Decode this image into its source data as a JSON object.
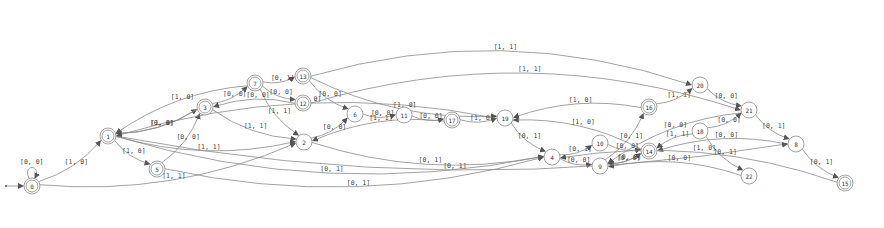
{
  "diagram": {
    "type": "finite-state-automaton",
    "start_state": "0",
    "nodes": [
      {
        "id": "0",
        "x": 32,
        "y": 186,
        "accepting": true
      },
      {
        "id": "1",
        "x": 108,
        "y": 136,
        "accepting": true
      },
      {
        "id": "5",
        "x": 157,
        "y": 169,
        "accepting": true
      },
      {
        "id": "3",
        "x": 205,
        "y": 107,
        "accepting": true
      },
      {
        "id": "7",
        "x": 255,
        "y": 83,
        "accepting": true
      },
      {
        "id": "13",
        "x": 303,
        "y": 76,
        "accepting": true
      },
      {
        "id": "12",
        "x": 303,
        "y": 103,
        "accepting": true
      },
      {
        "id": "2",
        "x": 304,
        "y": 142,
        "accepting": false
      },
      {
        "id": "6",
        "x": 355,
        "y": 114,
        "accepting": false
      },
      {
        "id": "11",
        "x": 404,
        "y": 115,
        "accepting": false
      },
      {
        "id": "17",
        "x": 452,
        "y": 120,
        "accepting": true
      },
      {
        "id": "19",
        "x": 505,
        "y": 118,
        "accepting": false
      },
      {
        "id": "4",
        "x": 552,
        "y": 157,
        "accepting": false
      },
      {
        "id": "10",
        "x": 600,
        "y": 143,
        "accepting": false
      },
      {
        "id": "9",
        "x": 600,
        "y": 166,
        "accepting": false
      },
      {
        "id": "16",
        "x": 649,
        "y": 107,
        "accepting": true
      },
      {
        "id": "14",
        "x": 649,
        "y": 151,
        "accepting": true
      },
      {
        "id": "20",
        "x": 700,
        "y": 85,
        "accepting": false
      },
      {
        "id": "18",
        "x": 700,
        "y": 131,
        "accepting": false
      },
      {
        "id": "21",
        "x": 749,
        "y": 110,
        "accepting": false
      },
      {
        "id": "22",
        "x": 749,
        "y": 176,
        "accepting": false
      },
      {
        "id": "8",
        "x": 796,
        "y": 144,
        "accepting": false
      },
      {
        "id": "15",
        "x": 845,
        "y": 183,
        "accepting": true
      }
    ],
    "edges": [
      {
        "from": "0",
        "to": "0",
        "label": "[0, 0]"
      },
      {
        "from": "0",
        "to": "1",
        "label": "[1, 0]"
      },
      {
        "from": "0",
        "to": "2",
        "label": "[1, 1]"
      },
      {
        "from": "1",
        "to": "5",
        "label": "[1, 0]"
      },
      {
        "from": "1",
        "to": "3",
        "label": "[0, 0]"
      },
      {
        "from": "3",
        "to": "1",
        "label": "[1, 0]"
      },
      {
        "from": "1",
        "to": "2",
        "label": "[1, 1]"
      },
      {
        "from": "1",
        "to": "4",
        "label": "[0, 1]"
      },
      {
        "from": "5",
        "to": "3",
        "label": "[0, 0]"
      },
      {
        "from": "5",
        "to": "4",
        "label": "[0, 1]"
      },
      {
        "from": "7",
        "to": "1",
        "label": "[1, 0]"
      },
      {
        "from": "3",
        "to": "7",
        "label": "[0, 0]"
      },
      {
        "from": "12",
        "to": "3",
        "label": "[0, 0]"
      },
      {
        "from": "3",
        "to": "2",
        "label": "[1, 1]"
      },
      {
        "from": "7",
        "to": "13",
        "label": "[0, 1]"
      },
      {
        "from": "7",
        "to": "12",
        "label": "[0, 0]"
      },
      {
        "from": "7",
        "to": "2",
        "label": "[1, 1]"
      },
      {
        "from": "13",
        "to": "6",
        "label": "[0, 0]"
      },
      {
        "from": "13",
        "to": "19",
        "label": "[1, 0]"
      },
      {
        "from": "13",
        "to": "20",
        "label": "[1, 1]"
      },
      {
        "from": "12",
        "to": "21",
        "label": "[1, 1]"
      },
      {
        "from": "2",
        "to": "6",
        "label": "[0, 0]"
      },
      {
        "from": "2",
        "to": "4",
        "label": "[0, 1]"
      },
      {
        "from": "17",
        "to": "2",
        "label": "[1, 1]"
      },
      {
        "from": "6",
        "to": "11",
        "label": "[0, 0]"
      },
      {
        "from": "11",
        "to": "17",
        "label": "[0, 0]"
      },
      {
        "from": "17",
        "to": "19",
        "label": "[1, 0]"
      },
      {
        "from": "19",
        "to": "4",
        "label": "[0, 1]"
      },
      {
        "from": "16",
        "to": "19",
        "label": "[1, 0]"
      },
      {
        "from": "14",
        "to": "19",
        "label": "[1, 0]"
      },
      {
        "from": "4",
        "to": "10",
        "label": "[0, 1]"
      },
      {
        "from": "4",
        "to": "9",
        "label": "[0, 0]"
      },
      {
        "from": "9",
        "to": "16",
        "label": "[0, 1]"
      },
      {
        "from": "10",
        "to": "14",
        "label": "[0, 0]"
      },
      {
        "from": "9",
        "to": "14",
        "label": "[0, 0]"
      },
      {
        "from": "14",
        "to": "9",
        "label": "[0, 0]"
      },
      {
        "from": "16",
        "to": "20",
        "label": "[1, 1]"
      },
      {
        "from": "21",
        "to": "9",
        "label": "[0, 0]"
      },
      {
        "from": "18",
        "to": "14",
        "label": "[1, 1]"
      },
      {
        "from": "20",
        "to": "21",
        "label": "[0, 0]"
      },
      {
        "from": "18",
        "to": "21",
        "label": "[0, 0]"
      },
      {
        "from": "8",
        "to": "14",
        "label": "[0, 0]"
      },
      {
        "from": "18",
        "to": "22",
        "label": "[0, 1]"
      },
      {
        "from": "22",
        "to": "9",
        "label": "[0, 0]"
      },
      {
        "from": "21",
        "to": "8",
        "label": "[0, 1]"
      },
      {
        "from": "1",
        "to": "8",
        "label": "[0, 1]"
      },
      {
        "from": "8",
        "to": "15",
        "label": "[0, 1]"
      },
      {
        "from": "15",
        "to": "4",
        "label": "[1, 0]"
      },
      {
        "from": "19",
        "to": "1",
        "label": "[1, 0]"
      }
    ]
  }
}
